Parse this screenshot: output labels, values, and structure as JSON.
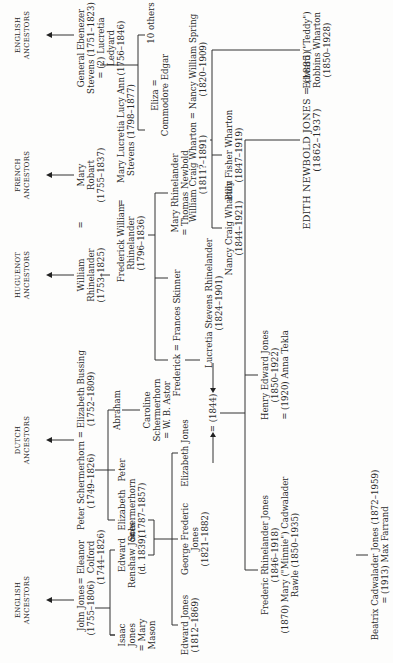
{
  "ancestors": {
    "english_left": "ENGLISH\nANCESTORS",
    "dutch": "DUTCH\nANCESTORS",
    "huguenot": "HUGUENOT\nANCESTORS",
    "french": "FRENCH\nANCESTORS",
    "english_right": "ENGLISH\nANCESTORS"
  },
  "gen1": {
    "john_jones": "John Jones\n(1755–1806)",
    "eq1": "=",
    "eleanor_colford": "Eleanor\nColford\n(1744–1826)",
    "peter_schermerhorn": "Peter Schermerhorn = Elizabeth Bussing\n(1749–1826)          (1752–1809)",
    "william_rhinelander": "William\nRhinelander\n(1753–1825)",
    "eq2": "=",
    "mary_robart": "Mary\nRobart\n(1755–1837)",
    "ebenezer_stevens": "General Ebenezer\nStevens (1751–1823)\n= (2) Lucretia\nLedyard\n(1756–1846)"
  },
  "gen2": {
    "isaac_jones": "Isaac\nJones\n= Mary\nMason",
    "edward_renshaw_jones": "Edward\nRenshaw Jones\n(d. 1839)",
    "eq3": "=",
    "elizabeth_schermerhorn": "Elizabeth\nSchermerhorn\n(1787–1857)",
    "peter": "Peter",
    "abraham": "Abraham",
    "caroline_schermerhorn": "Caroline\nSchermerhorn\n= W. B. Astor",
    "frederick_william_rhinelander": "Frederick William\nRhinelander\n(1796–1836)",
    "eq4": "=",
    "mary_lucretia_stevens": "Mary Lucretia Lucy Ann\nStevens (1798–1877)",
    "ten_others": "10 others"
  },
  "gen3": {
    "edward_jones": "Edward Jones\n(1812–1869)",
    "george_frederic_jones": "George Frederic\nJones\n(1821–1882)",
    "elizabeth_jones": "Elizabeth Jones",
    "marriage_1844": "= (1844)",
    "frederick_frances": "Frederick = Frances Skinner",
    "lucretia_stevens_rhinelander": "Lucretia Stevens Rhinelander\n(1824–1901)",
    "mary_rhinelander": "Mary Rhinelander\n= Thomas Newbold",
    "eliza": "Eliza =\nCommodore Edgar"
  },
  "wharton": {
    "william_craig_wharton": "William Craig Wharton = Nancy William Spring\n(1811?–1891)              (1820–1909)",
    "nancy_craig_wharton": "Nancy Craig Wharton\n(1844–1921)",
    "billy_fisher_wharton": "Billy Fisher Wharton\n(1847–1919)",
    "edward_teddy_wharton": "Edward (\"Teddy\")\nRobbins Wharton\n(1850–1928)"
  },
  "gen4": {
    "frederic_rhinelander_jones": "Frederic Rhinelander Jones\n(1846–1918)\n(1870) Mary (\"Minnie\") Cadwalader\nRawle (1850–1935)",
    "beatrix": "Beatrix Cadwalader Jones (1872–1959)\n= (1913) Max Farrand",
    "henry_edward_jones": "Henry Edward Jones\n(1850–1922)\n= (1920) Anna Tekla",
    "edith_newbold_jones": "EDITH NEWBOLD JONES = (1885)\n(1862–1937)"
  }
}
